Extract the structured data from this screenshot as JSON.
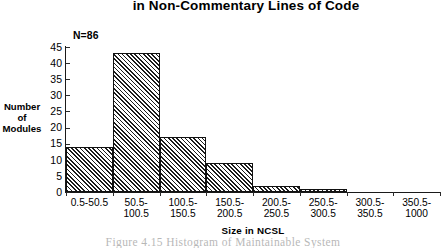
{
  "title": "in Non-Commentary Lines of Code",
  "annotation": "N=86",
  "caption": "Figure   4.15    Histogram   of Maintainable  System",
  "axes": {
    "y_title": "Number\nof\nModules",
    "x_title": "Size in NCSL"
  },
  "chart_data": {
    "type": "bar",
    "title": "in Non-Commentary Lines of Code",
    "xlabel": "Size in NCSL",
    "ylabel": "Number of Modules",
    "categories": [
      "0.5-50.5",
      "50.5-\n100.5",
      "100.5-\n150.5",
      "150.5-\n200.5",
      "200.5-\n250.5",
      "250.5-\n300.5",
      "300.5-\n350.5",
      "350.5-\n1000"
    ],
    "values": [
      14,
      43,
      17,
      9,
      2,
      1,
      0,
      0
    ],
    "ylim": [
      0,
      45
    ],
    "yticks": [
      0,
      5,
      10,
      15,
      20,
      25,
      30,
      35,
      40,
      45
    ],
    "ytick_labels": [
      "0",
      "5",
      "10",
      "15",
      "20",
      "25",
      "30",
      "35",
      "40",
      "45"
    ],
    "grid": false,
    "legend": false,
    "n_total": 86,
    "annotation": "N=86",
    "bar_fill": "diagonal-hatch",
    "colors": {
      "axis": "#1a1a1a",
      "bar_edge": "#111111",
      "bar_hatch": "#1c1c1c",
      "background": "#ffffff"
    }
  }
}
